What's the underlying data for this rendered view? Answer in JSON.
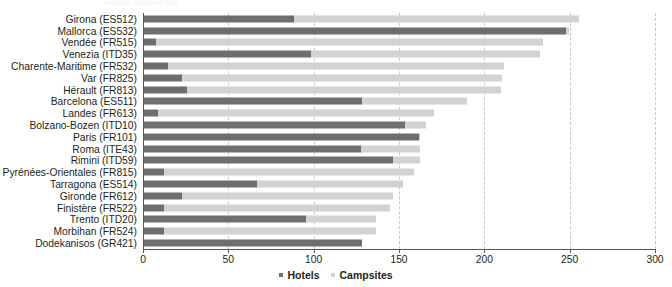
{
  "top_remnant": "partially cropped text",
  "chart_data": {
    "type": "bar",
    "orientation": "horizontal",
    "stacked": true,
    "title": "",
    "subtitle": "",
    "xlabel": "",
    "ylabel": "",
    "xlim": [
      0,
      300
    ],
    "xticks": [
      0,
      50,
      100,
      150,
      200,
      250,
      300
    ],
    "xtick_labels": [
      "0",
      "50",
      "100",
      "150",
      "200",
      "250",
      "300"
    ],
    "grid": "vertical-dashed",
    "legend_position": "bottom-center",
    "categories": [
      "Girona (ES512)",
      "Mallorca (ES532)",
      "Vendée (FR515)",
      "Venezia (ITD35)",
      "Charente-Maritime (FR532)",
      "Var (FR825)",
      "Hérault (FR813)",
      "Barcelona (ES511)",
      "Landes (FR613)",
      "Bolzano-Bozen (ITD10)",
      "Paris (FR101)",
      "Roma (ITE43)",
      "Rimini (ITD59)",
      "Pyrénées-Orientales (FR815)",
      "Tarragona (ES514)",
      "Gironde (FR612)",
      "Finistère (FR522)",
      "Trento (ITD20)",
      "Morbihan (FR524)",
      "Dodekanisos (GR421)"
    ],
    "series": [
      {
        "name": "Hotels",
        "color": "#6e6e6e",
        "values": [
          88,
          247,
          7,
          98,
          14,
          22,
          25,
          128,
          8,
          153,
          161,
          127,
          146,
          12,
          66,
          22,
          12,
          95,
          12,
          128
        ]
      },
      {
        "name": "Campsites",
        "color": "#d2d2d2",
        "values": [
          167,
          2,
          227,
          134,
          197,
          188,
          184,
          61,
          162,
          12,
          1,
          35,
          16,
          146,
          86,
          124,
          132,
          41,
          124,
          0
        ]
      }
    ],
    "totals": [
      255,
      249,
      234,
      232,
      211,
      210,
      209,
      189,
      170,
      165,
      162,
      162,
      162,
      158,
      152,
      146,
      144,
      136,
      136,
      128
    ]
  }
}
